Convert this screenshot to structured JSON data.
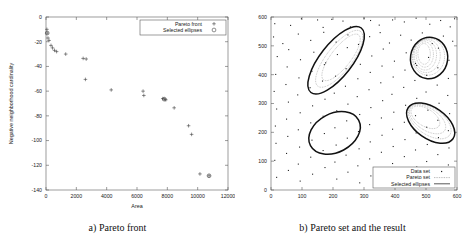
{
  "figure": {
    "panel_a_caption": "a) Pareto front",
    "panel_b_caption": "b) Pareto set and the result"
  },
  "chart_data": [
    {
      "type": "scatter",
      "title": "a) Pareto front",
      "xlabel": "Area",
      "ylabel": "Negative neighborhood cardinality",
      "xlim": [
        0,
        12000
      ],
      "ylim": [
        -140,
        0
      ],
      "xticks": [
        0,
        2000,
        4000,
        6000,
        8000,
        10000,
        12000
      ],
      "xtick_labels": [
        "0",
        "2000",
        "4000",
        "6000",
        "8000",
        "10000",
        "12000"
      ],
      "yticks": [
        -140,
        -120,
        -100,
        -80,
        -60,
        -40,
        -20,
        0
      ],
      "ytick_labels": [
        "-140",
        "-120",
        "-100",
        "-80",
        "-60",
        "-40",
        "-20",
        "0"
      ],
      "grid": false,
      "legend_position": "top-right",
      "legend": [
        {
          "label": "Pareto front",
          "marker": "plus"
        },
        {
          "label": "Selected ellipses",
          "marker": "circle"
        }
      ],
      "series": [
        {
          "name": "Pareto front",
          "marker": "plus",
          "points": [
            [
              60,
              -10
            ],
            [
              80,
              -13
            ],
            [
              130,
              -17
            ],
            [
              200,
              -19
            ],
            [
              330,
              -23
            ],
            [
              430,
              -25
            ],
            [
              560,
              -27
            ],
            [
              700,
              -28
            ],
            [
              1300,
              -30
            ],
            [
              2450,
              -33.5
            ],
            [
              2650,
              -34
            ],
            [
              2600,
              -50.5
            ],
            [
              4300,
              -59
            ],
            [
              6400,
              -60
            ],
            [
              6450,
              -63.5
            ],
            [
              7700,
              -66
            ],
            [
              7800,
              -66.5
            ],
            [
              7900,
              -67
            ],
            [
              8450,
              -73.5
            ],
            [
              9400,
              -88
            ],
            [
              9600,
              -95
            ],
            [
              10150,
              -127
            ],
            [
              10750,
              -128.5
            ]
          ]
        },
        {
          "name": "Selected ellipses",
          "marker": "circle",
          "points": [
            [
              80,
              -13
            ],
            [
              7800,
              -66.5
            ],
            [
              10750,
              -128.5
            ]
          ]
        }
      ]
    },
    {
      "type": "scatter",
      "title": "b) Pareto set and the result",
      "xlabel": "",
      "ylabel": "",
      "xlim": [
        0,
        600
      ],
      "ylim": [
        0,
        600
      ],
      "xticks": [
        0,
        100,
        200,
        300,
        400,
        500,
        600
      ],
      "xtick_labels": [
        "0",
        "100",
        "200",
        "300",
        "400",
        "500",
        "600"
      ],
      "yticks": [
        0,
        100,
        200,
        300,
        400,
        500,
        600
      ],
      "ytick_labels": [
        "0",
        "100",
        "200",
        "300",
        "400",
        "500",
        "600"
      ],
      "grid": false,
      "legend_position": "bottom-right",
      "legend": [
        {
          "label": "Data set",
          "marker": "dot"
        },
        {
          "label": "Pareto set",
          "marker": "dotted-line"
        },
        {
          "label": "Selected ellipses",
          "marker": "solid-line"
        }
      ],
      "series": [
        {
          "name": "Data set",
          "marker": "dot",
          "points": [
            [
              12,
              577
            ],
            [
              63,
              571
            ],
            [
              98,
              594
            ],
            [
              150,
              590
            ],
            [
              168,
              564
            ],
            [
              196,
              592
            ],
            [
              232,
              586
            ],
            [
              256,
              566
            ],
            [
              300,
              596
            ],
            [
              321,
              588
            ],
            [
              349,
              572
            ],
            [
              392,
              590
            ],
            [
              430,
              583
            ],
            [
              468,
              596
            ],
            [
              512,
              575
            ],
            [
              547,
              588
            ],
            [
              578,
              566
            ],
            [
              592,
              594
            ],
            [
              8,
              531
            ],
            [
              38,
              508
            ],
            [
              88,
              541
            ],
            [
              128,
              519
            ],
            [
              170,
              547
            ],
            [
              210,
              513
            ],
            [
              248,
              538
            ],
            [
              282,
              505
            ],
            [
              318,
              532
            ],
            [
              352,
              546
            ],
            [
              382,
              510
            ],
            [
              418,
              537
            ],
            [
              452,
              520
            ],
            [
              488,
              545
            ],
            [
              520,
              508
            ],
            [
              556,
              534
            ],
            [
              586,
              516
            ],
            [
              20,
              463
            ],
            [
              57,
              487
            ],
            [
              95,
              452
            ],
            [
              138,
              478
            ],
            [
              176,
              441
            ],
            [
              214,
              470
            ],
            [
              246,
              494
            ],
            [
              288,
              436
            ],
            [
              325,
              465
            ],
            [
              362,
              489
            ],
            [
              398,
              447
            ],
            [
              436,
              476
            ],
            [
              470,
              432
            ],
            [
              508,
              460
            ],
            [
              540,
              492
            ],
            [
              574,
              450
            ],
            [
              15,
              401
            ],
            [
              52,
              427
            ],
            [
              90,
              389
            ],
            [
              132,
              412
            ],
            [
              172,
              435
            ],
            [
              208,
              395
            ],
            [
              242,
              421
            ],
            [
              280,
              386
            ],
            [
              320,
              408
            ],
            [
              358,
              430
            ],
            [
              394,
              392
            ],
            [
              432,
              416
            ],
            [
              466,
              439
            ],
            [
              502,
              398
            ],
            [
              538,
              424
            ],
            [
              572,
              387
            ],
            [
              10,
              342
            ],
            [
              48,
              366
            ],
            [
              86,
              330
            ],
            [
              126,
              355
            ],
            [
              166,
              378
            ],
            [
              204,
              336
            ],
            [
              240,
              360
            ],
            [
              278,
              324
            ],
            [
              316,
              348
            ],
            [
              354,
              372
            ],
            [
              390,
              332
            ],
            [
              428,
              356
            ],
            [
              464,
              380
            ],
            [
              500,
              340
            ],
            [
              536,
              364
            ],
            [
              570,
              328
            ],
            [
              18,
              281
            ],
            [
              56,
              305
            ],
            [
              94,
              268
            ],
            [
              134,
              292
            ],
            [
              174,
              315
            ],
            [
              212,
              275
            ],
            [
              248,
              298
            ],
            [
              286,
              262
            ],
            [
              322,
              286
            ],
            [
              360,
              310
            ],
            [
              396,
              270
            ],
            [
              434,
              294
            ],
            [
              470,
              318
            ],
            [
              506,
              277
            ],
            [
              542,
              301
            ],
            [
              576,
              265
            ],
            [
              14,
              222
            ],
            [
              50,
              246
            ],
            [
              88,
              209
            ],
            [
              128,
              233
            ],
            [
              168,
              256
            ],
            [
              206,
              216
            ],
            [
              244,
              240
            ],
            [
              282,
              203
            ],
            [
              318,
              227
            ],
            [
              356,
              250
            ],
            [
              392,
              211
            ],
            [
              430,
              235
            ],
            [
              466,
              258
            ],
            [
              502,
              218
            ],
            [
              538,
              242
            ],
            [
              572,
              206
            ],
            [
              16,
              162
            ],
            [
              54,
              186
            ],
            [
              92,
              149
            ],
            [
              132,
              173
            ],
            [
              172,
              196
            ],
            [
              210,
              156
            ],
            [
              246,
              180
            ],
            [
              284,
              143
            ],
            [
              320,
              167
            ],
            [
              358,
              190
            ],
            [
              394,
              151
            ],
            [
              432,
              175
            ],
            [
              468,
              198
            ],
            [
              504,
              158
            ],
            [
              540,
              182
            ],
            [
              574,
              146
            ],
            [
              12,
              103
            ],
            [
              50,
              127
            ],
            [
              88,
              90
            ],
            [
              128,
              114
            ],
            [
              168,
              137
            ],
            [
              206,
              97
            ],
            [
              242,
              121
            ],
            [
              280,
              84
            ],
            [
              318,
              108
            ],
            [
              356,
              131
            ],
            [
              392,
              92
            ],
            [
              430,
              116
            ],
            [
              466,
              139
            ],
            [
              502,
              99
            ],
            [
              538,
              123
            ],
            [
              572,
              87
            ],
            [
              18,
              44
            ],
            [
              56,
              68
            ],
            [
              94,
              31
            ],
            [
              134,
              55
            ],
            [
              174,
              78
            ],
            [
              212,
              38
            ],
            [
              248,
              62
            ],
            [
              286,
              25
            ],
            [
              322,
              49
            ],
            [
              360,
              72
            ],
            [
              396,
              33
            ],
            [
              434,
              57
            ],
            [
              470,
              80
            ],
            [
              506,
              40
            ],
            [
              542,
              64
            ],
            [
              576,
              28
            ]
          ]
        },
        {
          "name": "Selected ellipses",
          "marker": "solid-line",
          "ellipses": [
            {
              "cx": 210,
              "cy": 450,
              "rx": 132,
              "ry": 56,
              "angle": -52
            },
            {
              "cx": 205,
              "cy": 198,
              "rx": 88,
              "ry": 67,
              "angle": -28
            },
            {
              "cx": 510,
              "cy": 458,
              "rx": 60,
              "ry": 72,
              "angle": 8
            },
            {
              "cx": 515,
              "cy": 232,
              "rx": 88,
              "ry": 54,
              "angle": 35
            }
          ]
        },
        {
          "name": "Pareto set",
          "marker": "dotted-line",
          "ellipses": [
            {
              "cx": 508,
              "cy": 462,
              "rx": 52,
              "ry": 64,
              "angle": 6
            },
            {
              "cx": 502,
              "cy": 465,
              "rx": 44,
              "ry": 58,
              "angle": 4
            },
            {
              "cx": 498,
              "cy": 468,
              "rx": 36,
              "ry": 52,
              "angle": 2
            },
            {
              "cx": 496,
              "cy": 470,
              "rx": 28,
              "ry": 44,
              "angle": 0
            },
            {
              "cx": 494,
              "cy": 472,
              "rx": 20,
              "ry": 36,
              "angle": -2
            },
            {
              "cx": 512,
              "cy": 238,
              "rx": 78,
              "ry": 46,
              "angle": 34
            },
            {
              "cx": 505,
              "cy": 245,
              "rx": 66,
              "ry": 38,
              "angle": 33
            },
            {
              "cx": 498,
              "cy": 252,
              "rx": 52,
              "ry": 30,
              "angle": 32
            },
            {
              "cx": 220,
              "cy": 455,
              "rx": 112,
              "ry": 44,
              "angle": -52
            },
            {
              "cx": 226,
              "cy": 460,
              "rx": 92,
              "ry": 34,
              "angle": -52
            }
          ]
        }
      ]
    }
  ]
}
